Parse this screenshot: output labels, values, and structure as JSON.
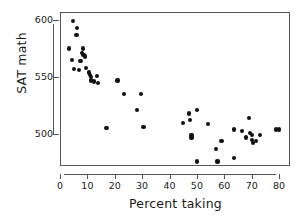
{
  "chart_data": {
    "type": "scatter",
    "title": "",
    "xlabel": "Percent taking",
    "ylabel": "SAT math",
    "xlim": [
      0,
      84
    ],
    "ylim": [
      472,
      607
    ],
    "xticks": [
      0,
      10,
      20,
      30,
      40,
      50,
      60,
      70,
      80
    ],
    "xtick_labels": [
      "0",
      "10",
      "20",
      "30",
      "40",
      "50",
      "60",
      "70",
      "80"
    ],
    "yticks": [
      500,
      550,
      600
    ],
    "ytick_labels": [
      "500",
      "550",
      "600"
    ],
    "grid": false,
    "legend": null,
    "marker": {
      "shape": "circle",
      "color": "#111111",
      "size": 4
    },
    "x": [
      4.8,
      6.3,
      6.0,
      3.4,
      8.5,
      8.0,
      8.6,
      9.0,
      4.5,
      7.5,
      5.0,
      6.8,
      9.6,
      10.5,
      11.0,
      11.2,
      11.4,
      13.5,
      12.5,
      14.0,
      17.0,
      21.0,
      23.5,
      28.0,
      30.5,
      29.5,
      45.0,
      47.0,
      47.5,
      48.0,
      48.0,
      50.0,
      50.0,
      54.0,
      57.0,
      57.5,
      59.0,
      63.5,
      63.5,
      66.5,
      68.0,
      69.0,
      69.5,
      70.0,
      70.0,
      70.5,
      71.5,
      73.0,
      79.0,
      80.0
    ],
    "y": [
      599,
      593,
      587,
      575,
      575,
      571,
      569,
      568,
      565,
      564,
      557,
      556,
      558,
      554,
      552,
      550,
      547,
      551,
      546,
      545,
      505,
      547,
      535,
      521,
      506,
      535,
      510,
      518,
      512,
      499,
      497,
      521,
      476,
      509,
      487,
      476,
      494,
      504,
      479,
      503,
      497,
      514,
      501,
      499,
      495,
      492,
      494,
      499,
      504,
      504
    ],
    "n_points": 50
  },
  "axes": {
    "y_title": "SAT math",
    "x_title": "Percent taking"
  }
}
